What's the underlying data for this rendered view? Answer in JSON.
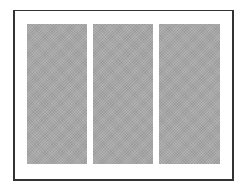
{
  "figure": {
    "frame_color": "#333333",
    "background_color": "#ffffff",
    "panel_color": "#a8a8a8",
    "panels": [
      {
        "name": "left-panel"
      },
      {
        "name": "center-panel"
      },
      {
        "name": "right-panel"
      }
    ]
  }
}
